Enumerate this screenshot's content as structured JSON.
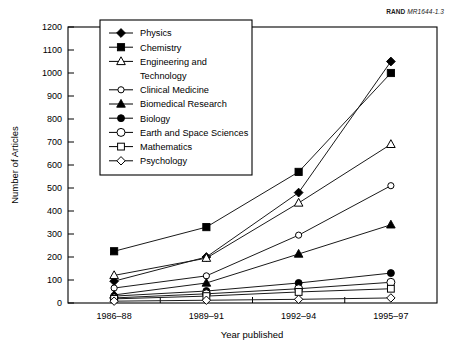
{
  "credit": {
    "org": "RAND",
    "doc_id": "MR1644-1.3"
  },
  "chart_data": {
    "type": "line",
    "title": "",
    "xlabel": "Year published",
    "ylabel": "Number of Articles",
    "categories": [
      "1986–88",
      "1989–91",
      "1992–94",
      "1995–97"
    ],
    "ylim": [
      0,
      1200
    ],
    "yticks": [
      0,
      100,
      200,
      300,
      400,
      500,
      600,
      700,
      800,
      900,
      1000,
      1100,
      1200
    ],
    "ytick_labels": [
      "0",
      "100",
      "200",
      "300",
      "400",
      "500",
      "600",
      "700",
      "800",
      "900",
      "1000",
      "1100",
      "1200"
    ],
    "grid": false,
    "legend_position": "upper-left-inside",
    "series": [
      {
        "name": "Physics",
        "marker": "filled-diamond",
        "values": [
          95,
          200,
          480,
          1050
        ]
      },
      {
        "name": "Chemistry",
        "marker": "filled-square",
        "values": [
          225,
          330,
          570,
          1000
        ]
      },
      {
        "name": "Engineering and Technology",
        "marker": "open-triangle",
        "values": [
          120,
          195,
          435,
          690
        ]
      },
      {
        "name": "Clinical Medicine",
        "marker": "open-circle-sm",
        "values": [
          65,
          118,
          295,
          510
        ]
      },
      {
        "name": "Biomedical Research",
        "marker": "filled-triangle",
        "values": [
          35,
          87,
          213,
          340
        ]
      },
      {
        "name": "Biology",
        "marker": "filled-circle",
        "values": [
          30,
          52,
          87,
          130
        ]
      },
      {
        "name": "Earth and Space Sciences",
        "marker": "open-circle-lg",
        "values": [
          22,
          40,
          62,
          90
        ]
      },
      {
        "name": "Mathematics",
        "marker": "open-square",
        "values": [
          18,
          30,
          48,
          62
        ]
      },
      {
        "name": "Psychology",
        "marker": "open-diamond",
        "values": [
          8,
          12,
          16,
          22
        ]
      }
    ]
  },
  "legend": {
    "items": [
      {
        "label": "Physics"
      },
      {
        "label": "Chemistry"
      },
      {
        "label": "Engineering and"
      },
      {
        "label": "Technology"
      },
      {
        "label": "Clinical Medicine"
      },
      {
        "label": "Biomedical Research"
      },
      {
        "label": "Biology"
      },
      {
        "label": "Earth and Space Sciences"
      },
      {
        "label": "Mathematics"
      },
      {
        "label": "Psychology"
      }
    ]
  }
}
